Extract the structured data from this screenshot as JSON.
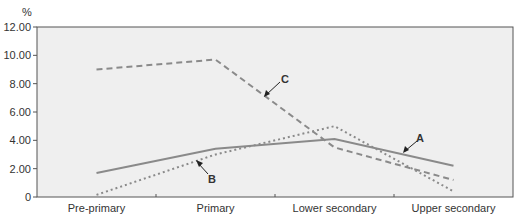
{
  "chart_data": {
    "type": "line",
    "title": "",
    "xlabel": "",
    "ylabel": "%",
    "ylim": [
      0,
      12
    ],
    "yticks": [
      "0",
      "2.00",
      "4.00",
      "6.00",
      "8.00",
      "10.00",
      "12.00"
    ],
    "categories": [
      "Pre-primary",
      "Primary",
      "Lower secondary",
      "Upper secondary"
    ],
    "grid": false,
    "legend": "inline labels with arrows",
    "series": [
      {
        "name": "A",
        "style": "solid",
        "color": "#8a8a8a",
        "values": [
          1.7,
          3.4,
          4.1,
          2.2
        ]
      },
      {
        "name": "B",
        "style": "dotted",
        "color": "#8a8a8a",
        "values": [
          0.15,
          3.0,
          5.0,
          0.4
        ]
      },
      {
        "name": "C",
        "style": "dashed",
        "color": "#8a8a8a",
        "values": [
          9.0,
          9.7,
          3.5,
          1.2
        ]
      }
    ],
    "annotations": [
      {
        "text": "A",
        "target_series": "A"
      },
      {
        "text": "B",
        "target_series": "B"
      },
      {
        "text": "C",
        "target_series": "C"
      }
    ]
  },
  "ui": {
    "ylabel": "%",
    "labels": {
      "a": "A",
      "b": "B",
      "c": "C"
    },
    "plot_bg": "#efefef",
    "axis_color": "#444444"
  }
}
